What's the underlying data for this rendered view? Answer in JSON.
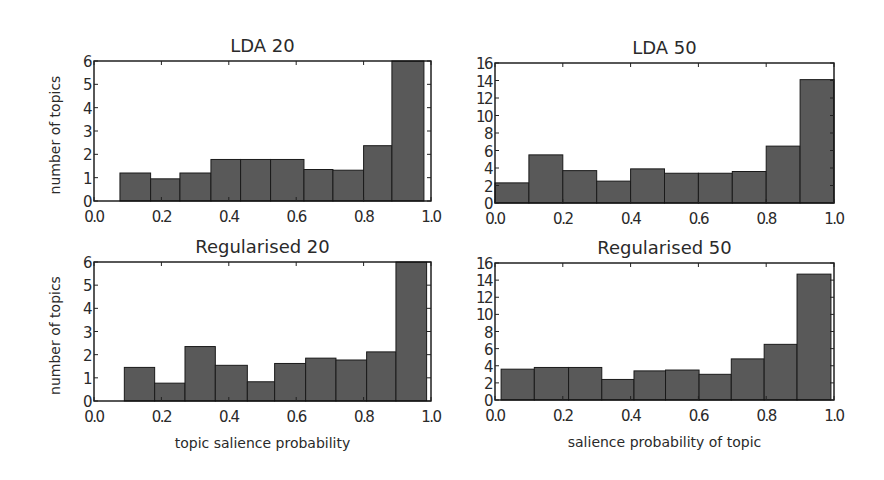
{
  "chart_data": [
    {
      "type": "bar",
      "id": "lda20",
      "title": "LDA 20",
      "xlabel": "",
      "ylabel": "number of topics",
      "xlim": [
        0.0,
        1.0
      ],
      "ylim": [
        0,
        6
      ],
      "xticks": [
        "0.0",
        "0.2",
        "0.4",
        "0.6",
        "0.8",
        "1.0"
      ],
      "yticks": [
        "0",
        "1",
        "2",
        "3",
        "4",
        "5",
        "6"
      ],
      "bin_edges": [
        0.077,
        0.168,
        0.255,
        0.347,
        0.435,
        0.524,
        0.623,
        0.709,
        0.8,
        0.884,
        0.979
      ],
      "values": [
        1.2,
        0.95,
        1.2,
        1.78,
        1.78,
        1.78,
        1.35,
        1.32,
        2.37,
        6.0
      ],
      "grid": false
    },
    {
      "type": "bar",
      "id": "lda50",
      "title": "LDA 50",
      "xlabel": "",
      "ylabel": "",
      "xlim": [
        0.0,
        1.0
      ],
      "ylim": [
        0,
        16
      ],
      "xticks": [
        "0.0",
        "0.2",
        "0.4",
        "0.6",
        "0.8",
        "1.0"
      ],
      "yticks": [
        "0",
        "2",
        "4",
        "6",
        "8",
        "10",
        "12",
        "14",
        "16"
      ],
      "bin_edges": [
        0.0,
        0.1,
        0.2,
        0.3,
        0.4,
        0.5,
        0.6,
        0.7,
        0.8,
        0.9,
        1.0
      ],
      "values": [
        2.3,
        5.5,
        3.7,
        2.5,
        3.9,
        3.4,
        3.4,
        3.6,
        6.5,
        14.1
      ],
      "grid": false
    },
    {
      "type": "bar",
      "id": "reg20",
      "title": "Regularised 20",
      "xlabel": "topic salience probability",
      "ylabel": "number of topics",
      "xlim": [
        0.0,
        1.0
      ],
      "ylim": [
        0,
        6
      ],
      "xticks": [
        "0.0",
        "0.2",
        "0.4",
        "0.6",
        "0.8",
        "1.0"
      ],
      "yticks": [
        "0",
        "1",
        "2",
        "3",
        "4",
        "5",
        "6"
      ],
      "bin_edges": [
        0.09,
        0.18,
        0.27,
        0.36,
        0.455,
        0.536,
        0.628,
        0.718,
        0.809,
        0.896,
        0.987
      ],
      "values": [
        1.45,
        0.77,
        2.35,
        1.54,
        0.83,
        1.62,
        1.85,
        1.77,
        2.12,
        6.0
      ],
      "grid": false
    },
    {
      "type": "bar",
      "id": "reg50",
      "title": "Regularised 50",
      "xlabel": "salience probability of topic",
      "ylabel": "",
      "xlim": [
        0.0,
        1.0
      ],
      "ylim": [
        0,
        16
      ],
      "xticks": [
        "0.0",
        "0.2",
        "0.4",
        "0.6",
        "0.8",
        "1.0"
      ],
      "yticks": [
        "0",
        "2",
        "4",
        "6",
        "8",
        "10",
        "12",
        "14",
        "16"
      ],
      "bin_edges": [
        0.018,
        0.116,
        0.217,
        0.315,
        0.41,
        0.503,
        0.602,
        0.697,
        0.794,
        0.891,
        0.991
      ],
      "values": [
        3.6,
        3.8,
        3.8,
        2.4,
        3.4,
        3.5,
        3.0,
        4.8,
        6.5,
        14.7
      ],
      "grid": false
    }
  ],
  "style": {
    "bar_fill": "#595959",
    "bar_edge": "#1a1a1a",
    "frame": "#111111",
    "background": "#ffffff"
  }
}
